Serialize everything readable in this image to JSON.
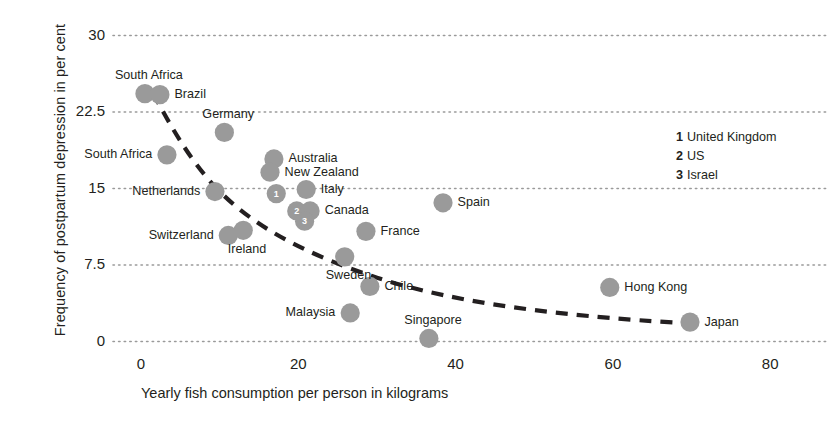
{
  "chart_data": {
    "type": "scatter",
    "title": "",
    "xlabel": "Yearly fish consumption per person in kilograms",
    "ylabel": "Frequency of postpartum depression in per cent",
    "xlim": [
      0,
      85
    ],
    "ylim": [
      0,
      30
    ],
    "xticks": [
      0,
      20,
      40,
      60,
      80
    ],
    "yticks": [
      0,
      7.5,
      15,
      22.5,
      30
    ],
    "xtick_labels": [
      "0",
      "20",
      "40",
      "60",
      "80"
    ],
    "ytick_labels": [
      "0",
      "7.5",
      "15",
      "22.5",
      "30"
    ],
    "grid": "horizontal-dotted",
    "legend_position": "top-right",
    "marker_color": "#9a9a9a",
    "trend_line": {
      "style": "dashed",
      "color": "#231f20",
      "description": "decaying curve from upper-left to lower-right"
    },
    "points": [
      {
        "label": "South Africa",
        "x": 0.5,
        "y": 24.3,
        "label_pos": "above",
        "marker": "dot"
      },
      {
        "label": "Brazil",
        "x": 2.4,
        "y": 24.2,
        "label_pos": "right",
        "marker": "dot"
      },
      {
        "label": "South Africa",
        "x": 3.3,
        "y": 18.3,
        "label_pos": "left",
        "marker": "dot"
      },
      {
        "label": "Germany",
        "x": 10.6,
        "y": 20.5,
        "label_pos": "above",
        "marker": "dot"
      },
      {
        "label": "Netherlands",
        "x": 9.4,
        "y": 14.7,
        "label_pos": "left",
        "marker": "dot"
      },
      {
        "label": "Switzerland",
        "x": 11.1,
        "y": 10.4,
        "label_pos": "left",
        "marker": "dot"
      },
      {
        "label": "Ireland",
        "x": 13.0,
        "y": 10.9,
        "label_pos": "below",
        "marker": "dot"
      },
      {
        "label": "Australia",
        "x": 16.9,
        "y": 17.9,
        "label_pos": "right",
        "marker": "dot"
      },
      {
        "label": "New Zealand",
        "x": 16.4,
        "y": 16.6,
        "label_pos": "right",
        "marker": "dot"
      },
      {
        "label": "United Kingdom",
        "x": 17.2,
        "y": 14.5,
        "label_pos": "none",
        "marker": "num",
        "num": "1"
      },
      {
        "label": "Italy",
        "x": 21.0,
        "y": 14.9,
        "label_pos": "right",
        "marker": "dot"
      },
      {
        "label": "US",
        "x": 19.8,
        "y": 12.8,
        "label_pos": "none",
        "marker": "num",
        "num": "2"
      },
      {
        "label": "Canada",
        "x": 21.5,
        "y": 12.8,
        "label_pos": "right",
        "marker": "dot"
      },
      {
        "label": "Israel",
        "x": 20.8,
        "y": 11.8,
        "label_pos": "none",
        "marker": "num",
        "num": "3"
      },
      {
        "label": "France",
        "x": 28.6,
        "y": 10.8,
        "label_pos": "right",
        "marker": "dot"
      },
      {
        "label": "Sweden",
        "x": 25.9,
        "y": 8.3,
        "label_pos": "below",
        "marker": "dot"
      },
      {
        "label": "Chile",
        "x": 29.1,
        "y": 5.4,
        "label_pos": "right",
        "marker": "dot"
      },
      {
        "label": "Malaysia",
        "x": 26.6,
        "y": 2.8,
        "label_pos": "left",
        "marker": "dot"
      },
      {
        "label": "Spain",
        "x": 38.4,
        "y": 13.6,
        "label_pos": "right",
        "marker": "dot"
      },
      {
        "label": "Singapore",
        "x": 36.6,
        "y": 0.3,
        "label_pos": "above",
        "marker": "dot"
      },
      {
        "label": "Hong Kong",
        "x": 59.6,
        "y": 5.3,
        "label_pos": "right",
        "marker": "dot"
      },
      {
        "label": "Japan",
        "x": 69.8,
        "y": 1.9,
        "label_pos": "right",
        "marker": "dot"
      }
    ]
  },
  "axes": {
    "y_title": "Frequency of postpartum depression in per cent",
    "x_title": "Yearly fish consumption per person in kilograms",
    "y_ticks": [
      {
        "value": 30,
        "text": "30"
      },
      {
        "value": 22.5,
        "text": "22.5"
      },
      {
        "value": 15,
        "text": "15"
      },
      {
        "value": 7.5,
        "text": "7.5"
      },
      {
        "value": 0,
        "text": "0"
      }
    ],
    "x_ticks": [
      {
        "value": 0,
        "text": "0"
      },
      {
        "value": 20,
        "text": "20"
      },
      {
        "value": 40,
        "text": "40"
      },
      {
        "value": 60,
        "text": "60"
      },
      {
        "value": 80,
        "text": "80"
      }
    ]
  },
  "legend": {
    "entries": [
      {
        "key": "1",
        "label": "United Kingdom"
      },
      {
        "key": "2",
        "label": "US"
      },
      {
        "key": "3",
        "label": "Israel"
      }
    ]
  },
  "point_labels": {
    "south_africa_1": "South Africa",
    "brazil": "Brazil",
    "south_africa_2": "South Africa",
    "germany": "Germany",
    "netherlands": "Netherlands",
    "switzerland": "Switzerland",
    "ireland": "Ireland",
    "australia": "Australia",
    "new_zealand": "New Zealand",
    "italy": "Italy",
    "canada": "Canada",
    "france": "France",
    "sweden": "Sweden",
    "chile": "Chile",
    "malaysia": "Malaysia",
    "spain": "Spain",
    "singapore": "Singapore",
    "hong_kong": "Hong Kong",
    "japan": "Japan"
  },
  "colors": {
    "marker": "#9a9a9a",
    "marker_edge": "#8f8f8f",
    "grid": "#9a9a9a",
    "text": "#231f20",
    "trend": "#231f20",
    "background": "#ffffff"
  }
}
